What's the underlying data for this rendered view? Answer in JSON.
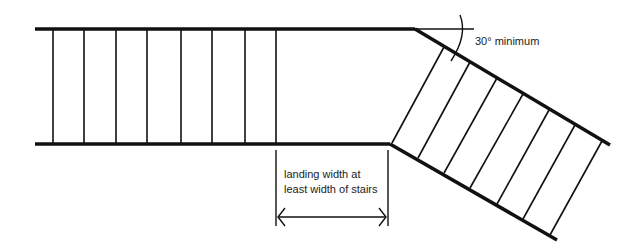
{
  "diagram": {
    "type": "stair plan with angled landing",
    "stroke_color": "#111111",
    "background": "#ffffff",
    "annotations": {
      "angle_label": "30° minimum",
      "landing_label_line1": "landing width at",
      "landing_label_line2": "least width of stairs"
    },
    "left_flight": {
      "tread_count": 8
    },
    "right_flight": {
      "tread_count": 7,
      "angle_degrees": 30
    }
  }
}
